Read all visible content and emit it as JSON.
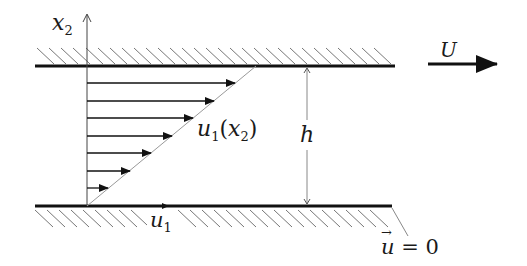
{
  "diagram": {
    "labels": {
      "x2_axis": {
        "main": "x",
        "sub": "2"
      },
      "velocity_profile": {
        "main": "u",
        "sub": "1",
        "paren_open": "(",
        "arg": "x",
        "arg_sub": "2",
        "paren_close": ")"
      },
      "gap_height": "h",
      "plate_velocity": "U",
      "flow_direction": {
        "main": "u",
        "sub": "1"
      },
      "no_slip": {
        "vector": "u",
        "arrow": "→",
        "equals": " = 0"
      }
    },
    "geometry": {
      "top_plate": {
        "x1": 35,
        "x2": 395,
        "y": 66,
        "moving": true
      },
      "bottom_plate": {
        "x1": 35,
        "x2": 392,
        "y": 206,
        "moving": false
      },
      "axis_x": 87,
      "profile_arrow_count": 7
    },
    "colors": {
      "line": "#111111",
      "thin_line": "#888888",
      "background": "#ffffff"
    }
  }
}
